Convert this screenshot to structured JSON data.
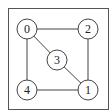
{
  "diagram": {
    "type": "undirected-graph",
    "frame": {
      "x": 8,
      "y": 8,
      "width": 101,
      "height": 102
    },
    "nodes": [
      {
        "id": "0",
        "label": "0",
        "x": 27,
        "y": 29
      },
      {
        "id": "1",
        "label": "1",
        "x": 88,
        "y": 90
      },
      {
        "id": "2",
        "label": "2",
        "x": 88,
        "y": 29
      },
      {
        "id": "3",
        "label": "3",
        "x": 57,
        "y": 60
      },
      {
        "id": "4",
        "label": "4",
        "x": 27,
        "y": 90
      }
    ],
    "edges": [
      {
        "from": "0",
        "to": "2"
      },
      {
        "from": "0",
        "to": "3"
      },
      {
        "from": "0",
        "to": "4"
      },
      {
        "from": "2",
        "to": "1"
      },
      {
        "from": "3",
        "to": "1"
      },
      {
        "from": "4",
        "to": "1"
      }
    ],
    "node_radius": 10,
    "stroke_color": "#444444"
  }
}
